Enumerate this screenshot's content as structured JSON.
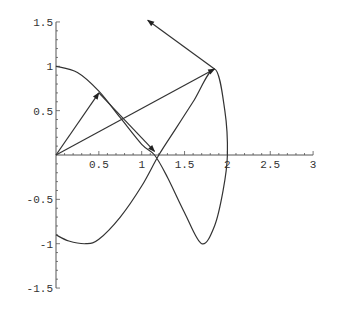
{
  "chart_data": {
    "type": "line",
    "title": "",
    "xlabel": "",
    "ylabel": "",
    "xlim": [
      0,
      3
    ],
    "ylim": [
      -1.5,
      1.5
    ],
    "grid": false,
    "x_ticks": [
      "0.5",
      "1",
      "1.5",
      "2",
      "2.5",
      "3"
    ],
    "y_ticks": [
      "1.5",
      "1",
      "0.5",
      "-0.5",
      "-1",
      "-1.5"
    ],
    "series": [
      {
        "name": "parametric-curve",
        "points": [
          [
            0,
            1
          ],
          [
            0.25,
            0.93
          ],
          [
            0.5,
            0.72
          ],
          [
            0.75,
            0.42
          ],
          [
            1.0,
            0.12
          ],
          [
            1.15,
            0
          ],
          [
            1.3,
            -0.25
          ],
          [
            1.5,
            -0.65
          ],
          [
            1.7,
            -1.0
          ],
          [
            1.85,
            -0.8
          ],
          [
            1.95,
            -0.4
          ],
          [
            2.0,
            0
          ],
          [
            1.97,
            0.5
          ],
          [
            1.85,
            0.97
          ],
          [
            1.6,
            0.6
          ],
          [
            1.4,
            0.3
          ],
          [
            1.2,
            0
          ],
          [
            1.0,
            -0.35
          ],
          [
            0.75,
            -0.7
          ],
          [
            0.5,
            -0.95
          ],
          [
            0.35,
            -1.0
          ],
          [
            0.15,
            -0.97
          ],
          [
            0,
            -0.9
          ]
        ]
      }
    ],
    "arrows": [
      {
        "from": [
          0,
          0
        ],
        "to": [
          0.5,
          0.7
        ]
      },
      {
        "from": [
          0.5,
          0.7
        ],
        "to": [
          1.15,
          0.04
        ]
      },
      {
        "from": [
          0,
          0
        ],
        "to": [
          1.85,
          0.97
        ]
      },
      {
        "from": [
          1.85,
          0.97
        ],
        "to": [
          1.07,
          1.52
        ]
      }
    ]
  }
}
